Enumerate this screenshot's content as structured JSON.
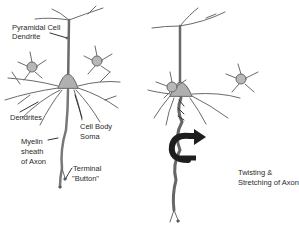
{
  "diagram": {
    "left_panel": {
      "labels": {
        "pyramidal_line1": "Pyramidal Cell",
        "pyramidal_line2": "Dendrite",
        "dendrites": "Dendrites",
        "cell_body_line1": "Cell Body",
        "cell_body_line2": "Soma",
        "myelin_line1": "Myelin",
        "myelin_line2": "sheath",
        "myelin_line3": "of Axon",
        "terminal_line1": "Terminal",
        "terminal_line2": "\"Button\""
      }
    },
    "right_panel": {
      "labels": {
        "twisting_line1": "Twisting &",
        "twisting_line2": "Stretching of Axon"
      }
    },
    "colors": {
      "neuron_stroke": "#5a5a5a",
      "neuron_fill": "#a8a8a8",
      "arrow": "#1e1e1e",
      "text": "#2a2a2a"
    }
  }
}
